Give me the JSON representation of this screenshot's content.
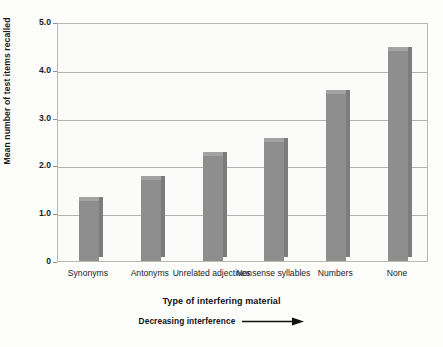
{
  "chart_data": {
    "type": "bar",
    "title": "",
    "categories": [
      "Synonyms",
      "Antonyms",
      "Unrelated adjectives",
      "Nonsense syllables",
      "Numbers",
      "None"
    ],
    "values": [
      1.25,
      1.7,
      2.2,
      2.5,
      3.5,
      4.4
    ],
    "xlabel": "Type of interfering material",
    "ylabel": "Mean number of test items recalled",
    "ylim": [
      0,
      5.0
    ],
    "yticks": [
      0,
      1.0,
      2.0,
      3.0,
      4.0,
      5.0
    ],
    "ytick_labels": [
      "0",
      "1.0",
      "2.0",
      "3.0",
      "4.0",
      "5.0"
    ],
    "grid": true,
    "legend": "none",
    "annotation": "Decreasing interference",
    "bar_color": "#8e8e8e"
  },
  "axes": {
    "y_title": "Mean number of test items recalled",
    "x_title": "Type of interfering material"
  },
  "annotation": {
    "label": "Decreasing interference",
    "arrow": "right-arrow-icon"
  },
  "ghost_text": {
    "line1": "recalling how much time on the same position",
    "line2": "memorization during interval the test — that is"
  },
  "colors": {
    "bar": "#8e8e8e",
    "bar_side": "#7c7c7c",
    "bar_top": "#a3a3a3",
    "grid": "#b3b3ae",
    "frame": "#b9b9b4",
    "plot_bg": "#fbfbfa",
    "page_bg": "#fdfdfc",
    "text": "#1b1b1b"
  }
}
